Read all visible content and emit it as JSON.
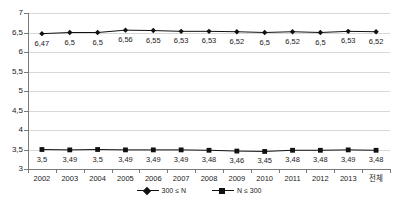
{
  "chart_data": {
    "type": "line",
    "title": "",
    "xlabel": "",
    "ylabel": "",
    "ylim": [
      3,
      7
    ],
    "ystep": 0.5,
    "grid": true,
    "decimal_separator": ",",
    "legend_position": "bottom",
    "categories": [
      "2002",
      "2003",
      "2004",
      "2005",
      "2006",
      "2007",
      "2008",
      "2009",
      "2010",
      "2011",
      "2012",
      "2013",
      "전체"
    ],
    "ytick_labels": [
      "7",
      "6,5",
      "6",
      "5,5",
      "5",
      "4,5",
      "4",
      "3,5",
      "3"
    ],
    "ytick_values": [
      7,
      6.5,
      6,
      5.5,
      5,
      4.5,
      4,
      3.5,
      3
    ],
    "series": [
      {
        "name": "300 ≤ N",
        "marker": "diamond",
        "color": "#111111",
        "values": [
          6.47,
          6.5,
          6.5,
          6.56,
          6.55,
          6.53,
          6.53,
          6.52,
          6.5,
          6.52,
          6.5,
          6.53,
          6.52
        ],
        "labels": [
          "6,47",
          "6,5",
          "6,5",
          "6,56",
          "6,55",
          "6,53",
          "6,53",
          "6,52",
          "6,5",
          "6,52",
          "6,5",
          "6,53",
          "6,52"
        ]
      },
      {
        "name": "N ≤ 300",
        "marker": "square",
        "color": "#111111",
        "values": [
          3.5,
          3.49,
          3.5,
          3.49,
          3.49,
          3.49,
          3.48,
          3.46,
          3.45,
          3.48,
          3.48,
          3.49,
          3.48
        ],
        "labels": [
          "3,5",
          "3,49",
          "3,5",
          "3,49",
          "3,49",
          "3,49",
          "3,48",
          "3,46",
          "3,45",
          "3,48",
          "3,48",
          "3,49",
          "3,48"
        ]
      }
    ]
  },
  "legend": {
    "items": [
      {
        "label": "300 ≤ N",
        "marker": "diamond"
      },
      {
        "label": "N ≤ 300",
        "marker": "square"
      }
    ]
  },
  "colors": {
    "series": "#111111",
    "gridline": "#d8d8d8",
    "axis": "#7a7a7a",
    "text": "#1a1a1a",
    "background": "#ffffff"
  }
}
